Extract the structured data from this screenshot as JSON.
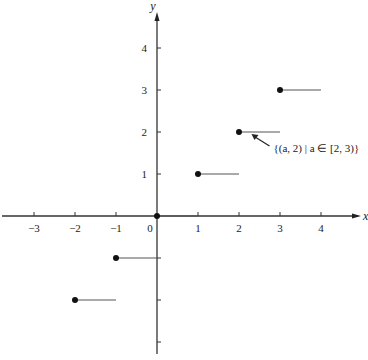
{
  "chart_data": {
    "type": "scatter",
    "title": "",
    "xlabel": "x",
    "ylabel": "y",
    "xlim": [
      -3.7,
      4.7
    ],
    "ylim": [
      -3.3,
      4.6
    ],
    "grid": false,
    "x_ticks": [
      -3,
      -2,
      -1,
      0,
      1,
      2,
      3,
      4
    ],
    "x_tick_labels": [
      "−3",
      "−2",
      "−1",
      "0",
      "1",
      "2",
      "3",
      "4"
    ],
    "y_ticks": [
      4,
      3,
      2,
      1,
      -1,
      -2,
      -3
    ],
    "y_tick_labels": [
      "4",
      "3",
      "2",
      "1",
      "",
      "",
      ""
    ],
    "series": [
      {
        "name": "step segments [a, a+1) at height a",
        "segments": [
          {
            "x_start": -2,
            "x_end": -1,
            "y": -2,
            "closed_left": true
          },
          {
            "x_start": -1,
            "x_end": 0,
            "y": -1,
            "closed_left": true
          },
          {
            "x_start": 0,
            "x_end": 1,
            "y": 0,
            "closed_left": true
          },
          {
            "x_start": 1,
            "x_end": 2,
            "y": 1,
            "closed_left": true
          },
          {
            "x_start": 2,
            "x_end": 3,
            "y": 2,
            "closed_left": true
          },
          {
            "x_start": 3,
            "x_end": 4,
            "y": 3,
            "closed_left": true
          }
        ]
      }
    ],
    "annotations": [
      {
        "text": "{(a, 2) | a ∈ [2, 3)}",
        "points_to": {
          "x": 2.5,
          "y": 2
        }
      }
    ]
  }
}
